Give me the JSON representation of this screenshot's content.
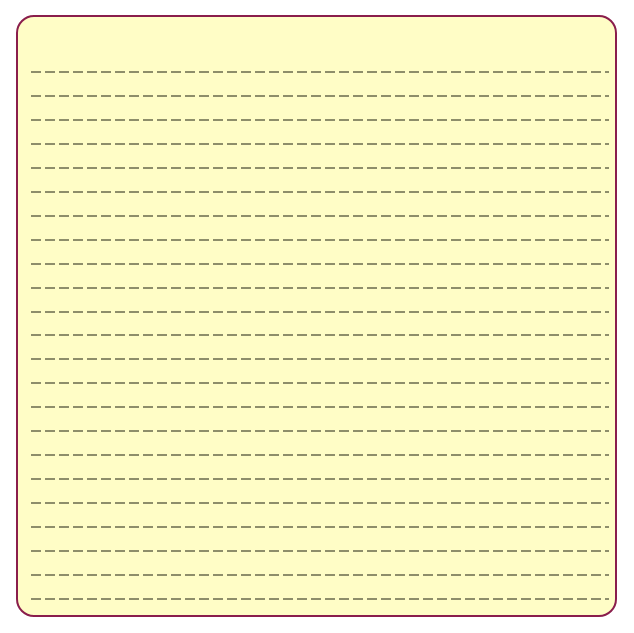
{
  "notepad": {
    "background_color": "#fffdc6",
    "border_color": "#8a1e4c",
    "line_color": "#7a7a5a",
    "line_count": 23,
    "line_style": "dashed"
  }
}
